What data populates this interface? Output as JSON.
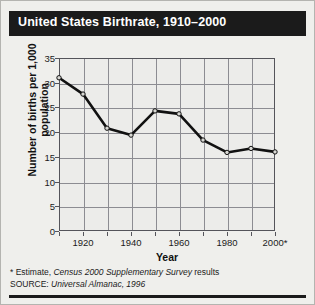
{
  "title": "United States Birthrate, 1910–2000",
  "chart_data": {
    "type": "line",
    "title": "United States Birthrate, 1910–2000",
    "xlabel": "Year",
    "ylabel": "Number of births per 1,000 population",
    "x": [
      1910,
      1920,
      1930,
      1940,
      1950,
      1960,
      1970,
      1980,
      1990,
      2000
    ],
    "values": [
      31.0,
      27.7,
      20.8,
      19.4,
      24.3,
      23.7,
      18.4,
      15.9,
      16.7,
      16.0
    ],
    "series": [
      {
        "name": "Births per 1,000 population",
        "values": [
          31.0,
          27.7,
          20.8,
          19.4,
          24.3,
          23.7,
          18.4,
          15.9,
          16.7,
          16.0
        ]
      }
    ],
    "xlim": [
      1910,
      2000
    ],
    "ylim": [
      0,
      35
    ],
    "yticks": [
      0,
      5,
      10,
      15,
      20,
      25,
      30,
      35
    ],
    "ytick_labels": [
      "0",
      "5",
      "10",
      "15",
      "20",
      "25",
      "30",
      "35"
    ],
    "xticks": [
      1910,
      1920,
      1930,
      1940,
      1950,
      1960,
      1970,
      1980,
      1990,
      2000
    ],
    "xtick_labels": [
      "",
      "1920",
      "",
      "1940",
      "",
      "1960",
      "",
      "1980",
      "",
      "2000*"
    ],
    "grid": true,
    "legend": "none",
    "marker": "circle",
    "line_color": "#111111",
    "marker_face_color": "#d8d8d4",
    "grid_color": "#8c8c92",
    "plot_bg": "#ececea"
  },
  "footnotes": {
    "estimate_prefix": "* Estimate, ",
    "estimate_italic": "Census 2000 Supplementary Survey",
    "estimate_suffix": " results",
    "source_prefix": "SOURCE: ",
    "source_italic": "Universal Almanac, 1996"
  },
  "colors": {
    "title_band": "#1b1b1b",
    "title_text": "#ffffff",
    "figure_bg": "#efefec",
    "axis": "#54545a"
  }
}
